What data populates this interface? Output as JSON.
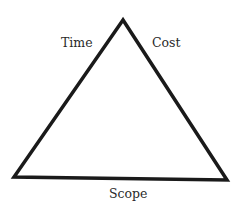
{
  "diagram": {
    "type": "triangle",
    "name": "Project management triangle",
    "stroke_color": "#1a1a1a",
    "stroke_width": 3.5,
    "vertices": {
      "apex": [
        123,
        20
      ],
      "bottom_left": [
        14,
        177
      ],
      "bottom_right": [
        227,
        180
      ]
    },
    "labels": {
      "left_side": "Time",
      "right_side": "Cost",
      "bottom_side": "Scope"
    }
  }
}
